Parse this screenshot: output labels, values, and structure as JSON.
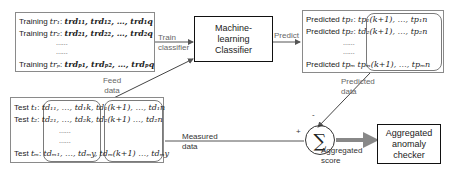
{
  "training_box": {
    "rows": [
      {
        "label": "Training ",
        "id": "tr₁",
        "values": "trd₁₁, trd₁₂, …, trd₁q"
      },
      {
        "label": "Training ",
        "id": "tr₂",
        "values": "trd₂₁, trd₂₂, …, trd₂q"
      },
      {
        "label": "Training ",
        "id": "trₚ",
        "values": "trdₚ₁, trdₚ₂, …, trdₚq"
      }
    ],
    "dots": "......"
  },
  "classifier": {
    "label": "Machine-learning Classifier"
  },
  "predicted_box": {
    "rows": [
      {
        "label": "Predicted ",
        "id": "tp₁",
        "values": "tp₁(k+1), …, tp₁n"
      },
      {
        "label": "Predicted ",
        "id": "tp₂",
        "values": "td₂(k+1), …, tp₂n"
      },
      {
        "label": "Predicted ",
        "id": "tpₘ",
        "values": "tpₘ(k+1), …, tpₘn"
      }
    ],
    "dots": "......"
  },
  "test_box": {
    "rows": [
      {
        "label": "Test ",
        "id": "t₁",
        "left": "td₁₁, …, td₁k,",
        "right": "td₁(k+1), …, td₁n"
      },
      {
        "label": "Test ",
        "id": "t₂",
        "left": "td₂₁, …, td₂k,",
        "right": "td₂(k+1) …, td₂n"
      },
      {
        "label": "Test ",
        "id": "tₘ",
        "left": "tdₘ₁, …, tdₘy,",
        "right": "tdₘ(k+1) …, tdₘy"
      }
    ],
    "dots": "......"
  },
  "sum_node": {
    "symbol": "∑",
    "plus": "+",
    "minus": "-"
  },
  "checker": {
    "label": "Aggregated anomaly checker"
  },
  "edges": {
    "train": "Train classifier",
    "predict": "Predict",
    "feed": "Feed data",
    "predicted": "Predicted data",
    "measured": "Measured data",
    "aggregated": "Aggregated score"
  }
}
